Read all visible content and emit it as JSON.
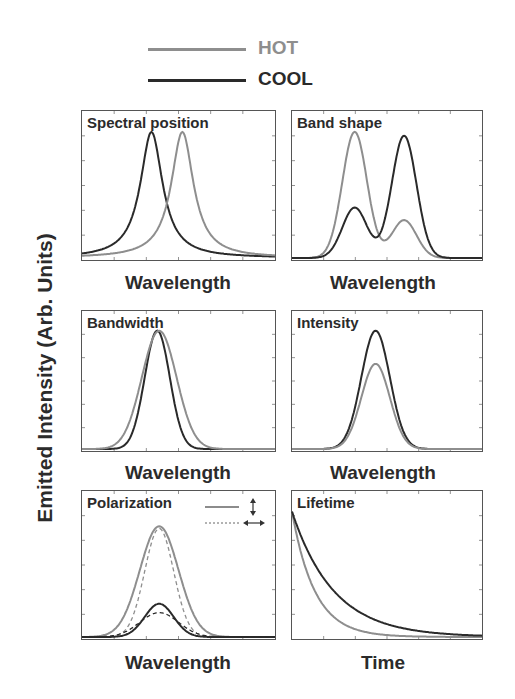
{
  "legend": [
    {
      "label": "HOT",
      "color": "#8e8e8e"
    },
    {
      "label": "COOL",
      "color": "#2a2a2a"
    }
  ],
  "ylabel": "Emitted Intensity (Arb. Units)",
  "panels": [
    {
      "title": "Spectral position",
      "xlabel": "Wavelength"
    },
    {
      "title": "Band shape",
      "xlabel": "Wavelength"
    },
    {
      "title": "Bandwidth",
      "xlabel": "Wavelength"
    },
    {
      "title": "Intensity",
      "xlabel": "Wavelength"
    },
    {
      "title": "Polarization",
      "xlabel": "Wavelength"
    },
    {
      "title": "Lifetime",
      "xlabel": "Time"
    }
  ],
  "chart_data": [
    {
      "type": "line",
      "title": "Spectral position",
      "xlabel": "Wavelength",
      "ylabel": "Emitted Intensity (Arb. Units)",
      "x_range": [
        0,
        1
      ],
      "ylim": [
        0,
        1.15
      ],
      "series": [
        {
          "name": "COOL",
          "shape": "lorentzian",
          "center": 0.36,
          "width": 0.07,
          "peak": 1.0
        },
        {
          "name": "HOT",
          "shape": "lorentzian",
          "center": 0.52,
          "width": 0.07,
          "peak": 1.0
        }
      ]
    },
    {
      "type": "line",
      "title": "Band shape",
      "xlabel": "Wavelength",
      "ylabel": "Emitted Intensity (Arb. Units)",
      "x_range": [
        0,
        1
      ],
      "ylim": [
        0,
        1.15
      ],
      "series": [
        {
          "name": "HOT",
          "shape": "two-gaussian",
          "peaks": [
            {
              "center": 0.33,
              "height": 1.0
            },
            {
              "center": 0.59,
              "height": 0.3
            }
          ]
        },
        {
          "name": "COOL",
          "shape": "two-gaussian",
          "peaks": [
            {
              "center": 0.33,
              "height": 0.4
            },
            {
              "center": 0.59,
              "height": 0.97
            }
          ]
        }
      ]
    },
    {
      "type": "line",
      "title": "Bandwidth",
      "xlabel": "Wavelength",
      "ylabel": "Emitted Intensity (Arb. Units)",
      "x_range": [
        0,
        1
      ],
      "ylim": [
        0,
        1.15
      ],
      "series": [
        {
          "name": "COOL",
          "shape": "gaussian",
          "center": 0.39,
          "sigma": 0.065,
          "peak": 1.0
        },
        {
          "name": "HOT",
          "shape": "gaussian",
          "center": 0.4,
          "sigma": 0.09,
          "peak": 1.0
        }
      ]
    },
    {
      "type": "line",
      "title": "Intensity",
      "xlabel": "Wavelength",
      "ylabel": "Emitted Intensity (Arb. Units)",
      "x_range": [
        0,
        1
      ],
      "ylim": [
        0,
        1.15
      ],
      "series": [
        {
          "name": "COOL",
          "shape": "gaussian",
          "center": 0.44,
          "sigma": 0.075,
          "peak": 1.0
        },
        {
          "name": "HOT",
          "shape": "gaussian",
          "center": 0.44,
          "sigma": 0.075,
          "peak": 0.72
        }
      ]
    },
    {
      "type": "line",
      "title": "Polarization",
      "xlabel": "Wavelength",
      "ylabel": "Emitted Intensity (Arb. Units)",
      "x_range": [
        0,
        1
      ],
      "ylim": [
        0,
        1.3
      ],
      "legend": [
        {
          "style": "solid",
          "label": "vertical polarization (↕)"
        },
        {
          "style": "dashed",
          "label": "horizontal polarization (↔)"
        }
      ],
      "series": [
        {
          "name": "HOT solid",
          "shape": "gaussian",
          "center": 0.4,
          "sigma": 0.1,
          "peak": 1.0
        },
        {
          "name": "HOT dashed",
          "shape": "gaussian",
          "center": 0.4,
          "sigma": 0.075,
          "peak": 0.98
        },
        {
          "name": "COOL solid",
          "shape": "gaussian",
          "center": 0.4,
          "sigma": 0.075,
          "peak": 0.3
        },
        {
          "name": "COOL dashed",
          "shape": "gaussian",
          "center": 0.4,
          "sigma": 0.1,
          "peak": 0.22
        }
      ]
    },
    {
      "type": "line",
      "title": "Lifetime",
      "xlabel": "Time",
      "ylabel": "Emitted Intensity (Arb. Units)",
      "x_range": [
        0,
        1
      ],
      "ylim": [
        0,
        1.0
      ],
      "series": [
        {
          "name": "HOT",
          "shape": "exp-decay",
          "start": 0.87,
          "tau": 0.12
        },
        {
          "name": "COOL",
          "shape": "exp-decay",
          "start": 0.87,
          "tau": 0.22
        }
      ]
    }
  ]
}
